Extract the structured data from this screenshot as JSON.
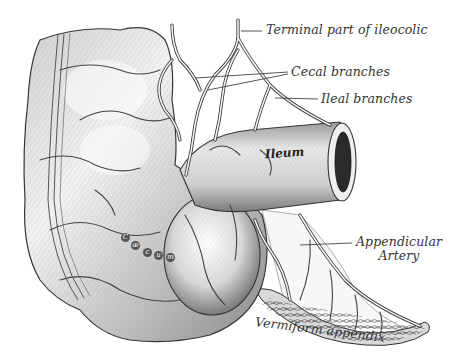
{
  "figure": {
    "style": "monochrome anatomical engraving",
    "colors": {
      "background": "#ffffff",
      "ink": "#333333",
      "shade_light": "#e6e6e6",
      "shade_mid": "#bdbdbd",
      "shade_dark": "#6e6e6e",
      "lumen": "#2a2a2a"
    }
  },
  "labels": {
    "terminal_ileocolic": "Terminal part of ileocolic",
    "cecal_branches": "Cecal branches",
    "ileal_branches": "Ileal branches",
    "ileum": "Ileum",
    "cecum": [
      "C",
      "æ",
      "c",
      "u",
      "m"
    ],
    "appendicular_artery_line1": "Appendicular",
    "appendicular_artery_line2": "Artery",
    "vermiform_appendix": "Vermiform appendix"
  }
}
